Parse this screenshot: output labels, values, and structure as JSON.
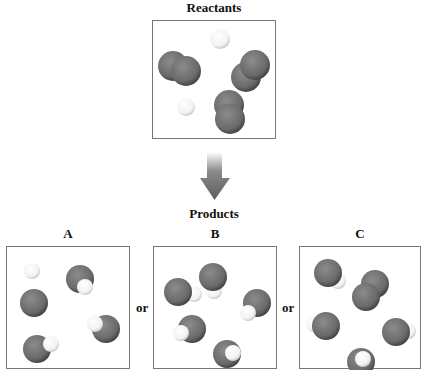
{
  "reactants": {
    "title": "Reactants",
    "molecules": [
      {
        "type": "H2",
        "atoms": [
          {
            "x": 67,
            "y": 18,
            "r": 10,
            "el": "H"
          }
        ]
      },
      {
        "type": "O2",
        "atoms": [
          {
            "x": 20,
            "y": 45,
            "r": 15,
            "el": "O"
          },
          {
            "x": 33,
            "y": 50,
            "r": 15,
            "el": "O"
          }
        ]
      },
      {
        "type": "O2",
        "atoms": [
          {
            "x": 93,
            "y": 56,
            "r": 15,
            "el": "O"
          },
          {
            "x": 102,
            "y": 44,
            "r": 15,
            "el": "O"
          }
        ]
      },
      {
        "type": "H2",
        "atoms": [
          {
            "x": 33,
            "y": 86,
            "r": 9,
            "el": "H"
          }
        ]
      },
      {
        "type": "O2",
        "atoms": [
          {
            "x": 76,
            "y": 84,
            "r": 15,
            "el": "O"
          },
          {
            "x": 77,
            "y": 98,
            "r": 15,
            "el": "O"
          }
        ]
      }
    ]
  },
  "arrow": {
    "direction": "down",
    "color": "#6e6e6e"
  },
  "products": {
    "title": "Products",
    "separator": "or",
    "options": [
      {
        "label": "A",
        "molecules": [
          {
            "type": "OH",
            "atoms": [
              {
                "x": 25,
                "y": 24,
                "r": 8,
                "el": "H"
              },
              {
                "x": 27,
                "y": 56,
                "r": 14,
                "el": "O"
              }
            ]
          },
          {
            "type": "OH",
            "atoms": [
              {
                "x": 73,
                "y": 32,
                "r": 14,
                "el": "O"
              },
              {
                "x": 78,
                "y": 40,
                "r": 8,
                "el": "H"
              }
            ]
          },
          {
            "type": "OH",
            "atoms": [
              {
                "x": 99,
                "y": 82,
                "r": 14,
                "el": "O"
              },
              {
                "x": 88,
                "y": 77,
                "r": 8,
                "el": "H"
              }
            ]
          },
          {
            "type": "OH",
            "atoms": [
              {
                "x": 30,
                "y": 102,
                "r": 14,
                "el": "O"
              },
              {
                "x": 44,
                "y": 97,
                "r": 8,
                "el": "H"
              }
            ]
          }
        ]
      },
      {
        "label": "B",
        "molecules": [
          {
            "type": "OH",
            "atoms": [
              {
                "x": 60,
                "y": 44,
                "r": 8,
                "el": "H"
              },
              {
                "x": 59,
                "y": 30,
                "r": 14,
                "el": "O"
              }
            ]
          },
          {
            "type": "OH",
            "atoms": [
              {
                "x": 40,
                "y": 47,
                "r": 8,
                "el": "H"
              },
              {
                "x": 24,
                "y": 45,
                "r": 14,
                "el": "O"
              }
            ]
          },
          {
            "type": "OH",
            "atoms": [
              {
                "x": 103,
                "y": 56,
                "r": 14,
                "el": "O"
              },
              {
                "x": 94,
                "y": 66,
                "r": 8,
                "el": "H"
              }
            ]
          },
          {
            "type": "OH",
            "atoms": [
              {
                "x": 38,
                "y": 82,
                "r": 14,
                "el": "O"
              },
              {
                "x": 27,
                "y": 86,
                "r": 8,
                "el": "H"
              }
            ]
          },
          {
            "type": "OH",
            "atoms": [
              {
                "x": 73,
                "y": 107,
                "r": 14,
                "el": "O"
              },
              {
                "x": 79,
                "y": 106,
                "r": 8,
                "el": "H"
              }
            ]
          }
        ]
      },
      {
        "label": "C",
        "molecules": [
          {
            "type": "OH",
            "atoms": [
              {
                "x": 38,
                "y": 34,
                "r": 8,
                "el": "H"
              },
              {
                "x": 28,
                "y": 26,
                "r": 14,
                "el": "O"
              }
            ]
          },
          {
            "type": "O2",
            "atoms": [
              {
                "x": 75,
                "y": 37,
                "r": 14,
                "el": "O"
              },
              {
                "x": 66,
                "y": 50,
                "r": 14,
                "el": "O"
              }
            ]
          },
          {
            "type": "OH",
            "atoms": [
              {
                "x": 14,
                "y": 77,
                "r": 8,
                "el": "H"
              },
              {
                "x": 26,
                "y": 79,
                "r": 14,
                "el": "O"
              }
            ]
          },
          {
            "type": "OH",
            "atoms": [
              {
                "x": 108,
                "y": 84,
                "r": 8,
                "el": "H"
              },
              {
                "x": 96,
                "y": 85,
                "r": 14,
                "el": "O"
              }
            ]
          },
          {
            "type": "OH",
            "atoms": [
              {
                "x": 61,
                "y": 115,
                "r": 14,
                "el": "O"
              },
              {
                "x": 63,
                "y": 112,
                "r": 8,
                "el": "H"
              }
            ]
          }
        ]
      }
    ]
  },
  "colors": {
    "oxygen": "#6a6a6a",
    "hydrogen": "#f2f2f2",
    "border": "#777777"
  }
}
